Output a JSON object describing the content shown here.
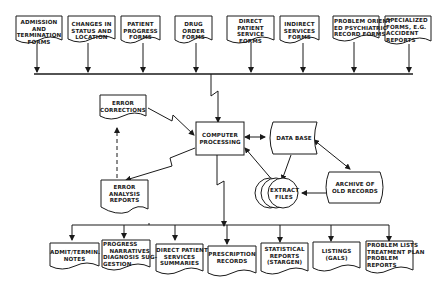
{
  "diagram": {
    "colors": {
      "background": "#ffffff",
      "ink": "#1a1a1a"
    },
    "input_forms": [
      {
        "lines": [
          "ADMISSION",
          "AND",
          "TERMINATION",
          "FORMS"
        ]
      },
      {
        "lines": [
          "CHANGES IN",
          "STATUS AND",
          "LOCATION"
        ]
      },
      {
        "lines": [
          "PATIENT",
          "PROGRESS",
          "FORMS"
        ]
      },
      {
        "lines": [
          "DRUG",
          "ORDER",
          "FORMS"
        ]
      },
      {
        "lines": [
          "DIRECT",
          "PATIENT",
          "SERVICE",
          "FORMS"
        ]
      },
      {
        "lines": [
          "INDIRECT",
          "SERVICES",
          "FORMS"
        ]
      },
      {
        "lines": [
          "PROBLEM ORIENT",
          "ED PSYCHIATRIC",
          "RECORD FORMS"
        ]
      },
      {
        "lines": [
          "SPECIALIZED",
          "FORMS, E.G.",
          "ACCIDENT",
          "REPORTS"
        ]
      }
    ],
    "error_corrections": {
      "lines": [
        "ERROR",
        "CORRECTIONS"
      ]
    },
    "computer_processing": {
      "lines": [
        "COMPUTER",
        "PROCESSING"
      ]
    },
    "data_base": {
      "lines": [
        "DATA BASE"
      ]
    },
    "archive": {
      "lines": [
        "ARCHIVE OF",
        "OLD RECORDS"
      ]
    },
    "extract_files": {
      "lines": [
        "EXTRACT",
        "FILES"
      ]
    },
    "error_analysis": {
      "lines": [
        "ERROR",
        "ANALYSIS",
        "REPORTS"
      ]
    },
    "output_reports": [
      {
        "lines": [
          "ADMIT/TERMIN.",
          "NOTES"
        ]
      },
      {
        "lines": [
          "PROGRESS",
          "NARRATIVES",
          "DIAGNOSIS SUG-",
          "GESTION"
        ]
      },
      {
        "lines": [
          "DIRECT PATIENT",
          "SERVICES",
          "SUMMARIES"
        ]
      },
      {
        "lines": [
          "PRESCRIPTION",
          "RECORDS"
        ]
      },
      {
        "lines": [
          "STATISTICAL",
          "REPORTS",
          "(STARGEN)"
        ]
      },
      {
        "lines": [
          "LISTINGS",
          "(GALS)"
        ]
      },
      {
        "lines": [
          "PROBLEM LISTS",
          "TREATMENT PLAN",
          "PROBLEM",
          "REPORTS"
        ]
      }
    ]
  }
}
